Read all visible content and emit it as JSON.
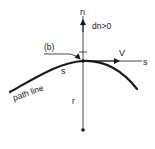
{
  "diagram": {
    "type": "streamline-coordinate-system",
    "labels": {
      "n_axis": "n",
      "dn_condition": "dn>0",
      "point_label": "(b)",
      "velocity": "V",
      "s_axis": "s",
      "path_line": "path line",
      "path_s": "s",
      "radius": "r"
    },
    "colors": {
      "ink": "#1a1a1a",
      "background": "#ffffff"
    }
  }
}
